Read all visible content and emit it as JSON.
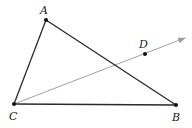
{
  "figure": {
    "width": 192,
    "height": 128,
    "points": {
      "A": {
        "label": "A",
        "x": 46,
        "y": 20,
        "lx": 40,
        "ly": 14
      },
      "B": {
        "label": "B",
        "x": 176,
        "y": 105,
        "lx": 172,
        "ly": 121
      },
      "C": {
        "label": "C",
        "x": 14,
        "y": 104,
        "lx": 9,
        "ly": 120
      },
      "D": {
        "label": "D",
        "x": 145,
        "y": 54,
        "lx": 139,
        "ly": 48
      }
    },
    "segments": [
      {
        "from": "A",
        "to": "B"
      },
      {
        "from": "A",
        "to": "C"
      },
      {
        "from": "C",
        "to": "B"
      }
    ],
    "ray": {
      "from": "C",
      "through": "D",
      "end": {
        "x": 185,
        "y": 38
      }
    },
    "colors": {
      "triangle": "#2a2a2a",
      "ray": "#a0a0a0",
      "point": "#111111",
      "label": "#222222"
    }
  }
}
